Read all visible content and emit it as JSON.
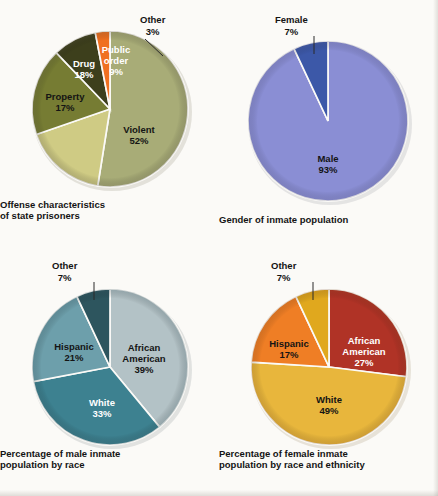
{
  "figure": {
    "background_color": "#fbfaf7",
    "label_dark": "#141414",
    "label_light": "#ffffff"
  },
  "chart_data": [
    {
      "type": "pie",
      "id": "offense-characteristics",
      "title": "Offense characteristics of state prisoners",
      "title_line1": "Offense characteristics",
      "title_line2": "of state prisoners",
      "categories": [
        "Violent",
        "Public order",
        "Other",
        "Drug",
        "Property"
      ],
      "values": [
        52,
        9,
        3,
        18,
        17
      ],
      "units": "percent",
      "legend": "none",
      "slices": [
        {
          "label": "Violent",
          "label_line1": "Violent",
          "label_line2": "52%",
          "value": 52,
          "color": "#a8ac77",
          "text_color": "#141414",
          "inline": true
        },
        {
          "label": "Public order",
          "label_line1": "Public",
          "label_line2": "order",
          "label_line3": "9%",
          "value": 9,
          "color": "#3d3f1c",
          "text_color": "#ffffff",
          "inline": true
        },
        {
          "label": "Other",
          "label_line1": "Other",
          "label_line2": "3%",
          "value": 3,
          "color": "#f07020",
          "text_color": "#141414",
          "inline": false
        },
        {
          "label": "Drug",
          "label_line1": "Drug",
          "label_line2": "18%",
          "value": 18,
          "color": "#767c33",
          "text_color": "#ffffff",
          "inline": true
        },
        {
          "label": "Property",
          "label_line1": "Property",
          "label_line2": "17%",
          "value": 17,
          "color": "#cfcb84",
          "text_color": "#141414",
          "inline": true
        }
      ]
    },
    {
      "type": "pie",
      "id": "gender-of-inmate-population",
      "title": "Gender of inmate population",
      "title_line1": "Gender of inmate population",
      "title_line2": "",
      "categories": [
        "Male",
        "Female"
      ],
      "values": [
        93,
        7
      ],
      "units": "percent",
      "legend": "none",
      "slices": [
        {
          "label": "Male",
          "label_line1": "Male",
          "label_line2": "93%",
          "value": 93,
          "color": "#8a8ed4",
          "text_color": "#141414",
          "inline": true
        },
        {
          "label": "Female",
          "label_line1": "Female",
          "label_line2": "7%",
          "value": 7,
          "color": "#3c58a8",
          "text_color": "#141414",
          "inline": false
        }
      ]
    },
    {
      "type": "pie",
      "id": "male-inmate-population-by-race",
      "title": "Percentage of male inmate population by race",
      "title_line1": "Percentage of male inmate",
      "title_line2": "population by race",
      "categories": [
        "African American",
        "White",
        "Hispanic",
        "Other"
      ],
      "values": [
        39,
        33,
        21,
        7
      ],
      "units": "percent",
      "legend": "none",
      "slices": [
        {
          "label": "African American",
          "label_line1": "African",
          "label_line2": "American",
          "label_line3": "39%",
          "value": 39,
          "color": "#b3c2c6",
          "text_color": "#141414",
          "inline": true
        },
        {
          "label": "White",
          "label_line1": "White",
          "label_line2": "33%",
          "value": 33,
          "color": "#3d8190",
          "text_color": "#ffffff",
          "inline": true
        },
        {
          "label": "Hispanic",
          "label_line1": "Hispanic",
          "label_line2": "21%",
          "value": 21,
          "color": "#6d9fab",
          "text_color": "#141414",
          "inline": true
        },
        {
          "label": "Other",
          "label_line1": "Other",
          "label_line2": "7%",
          "value": 7,
          "color": "#2d555e",
          "text_color": "#141414",
          "inline": false
        }
      ]
    },
    {
      "type": "pie",
      "id": "female-inmate-population-by-race-ethnicity",
      "title": "Percentage of female inmate population by race and ethnicity",
      "title_line1": "Percentage of female inmate",
      "title_line2": "population by race and ethnicity",
      "categories": [
        "African American",
        "White",
        "Hispanic",
        "Other"
      ],
      "values": [
        27,
        49,
        17,
        7
      ],
      "units": "percent",
      "legend": "none",
      "slices": [
        {
          "label": "African American",
          "label_line1": "African",
          "label_line2": "American",
          "label_line3": "27%",
          "value": 27,
          "color": "#b03326",
          "text_color": "#ffffff",
          "inline": true
        },
        {
          "label": "White",
          "label_line1": "White",
          "label_line2": "49%",
          "value": 49,
          "color": "#e8b63c",
          "text_color": "#141414",
          "inline": true
        },
        {
          "label": "Hispanic",
          "label_line1": "Hispanic",
          "label_line2": "17%",
          "value": 17,
          "color": "#ef7e25",
          "text_color": "#141414",
          "inline": true
        },
        {
          "label": "Other",
          "label_line1": "Other",
          "label_line2": "7%",
          "value": 7,
          "color": "#e0a81e",
          "text_color": "#141414",
          "inline": false
        }
      ]
    }
  ]
}
